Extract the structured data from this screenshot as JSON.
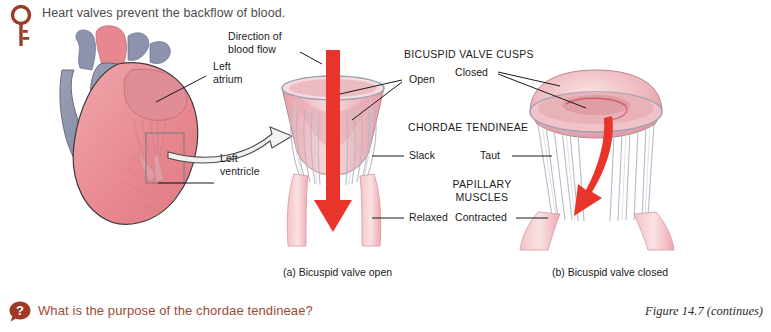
{
  "page": {
    "background": "#ffffff",
    "accent_red": "#9c4b33",
    "arrow_red": "#e8342a",
    "tissue_pink": "#efb7bb",
    "tissue_blue": "#8d93ad"
  },
  "intro": {
    "icon": "key-icon",
    "text": "Heart valves prevent the backflow of blood."
  },
  "question": {
    "icon": "question-bubble-icon",
    "text": "What is the purpose of the chordae tendineae?",
    "mark": "?"
  },
  "caption": {
    "text": "Figure 14.7 (continues)"
  },
  "heart_diagram": {
    "labels": [
      {
        "name": "left-atrium",
        "lines": [
          "Left",
          "atrium"
        ]
      },
      {
        "name": "left-ventricle",
        "lines": [
          "Left",
          "ventricle"
        ]
      }
    ]
  },
  "valve_open": {
    "subcaption": "(a) Bicuspid valve open",
    "labels": [
      {
        "name": "direction-of-blood-flow",
        "lines": [
          "Direction of",
          "blood flow"
        ]
      },
      {
        "name": "cusps-open",
        "text": "Open"
      },
      {
        "name": "chordae-slack",
        "text": "Slack"
      },
      {
        "name": "papillary-relaxed",
        "text": "Relaxed"
      }
    ]
  },
  "valve_closed": {
    "subcaption": "(b) Bicuspid valve closed",
    "labels": [
      {
        "name": "cusps-closed",
        "text": "Closed"
      },
      {
        "name": "chordae-taut",
        "text": "Taut"
      },
      {
        "name": "papillary-contracted",
        "text": "Contracted"
      }
    ]
  },
  "headings": {
    "cusps": "BICUSPID VALVE CUSPS",
    "chordae": "CHORDAE TENDINEAE",
    "papillary_line1": "PAPILLARY",
    "papillary_line2": "MUSCLES"
  }
}
